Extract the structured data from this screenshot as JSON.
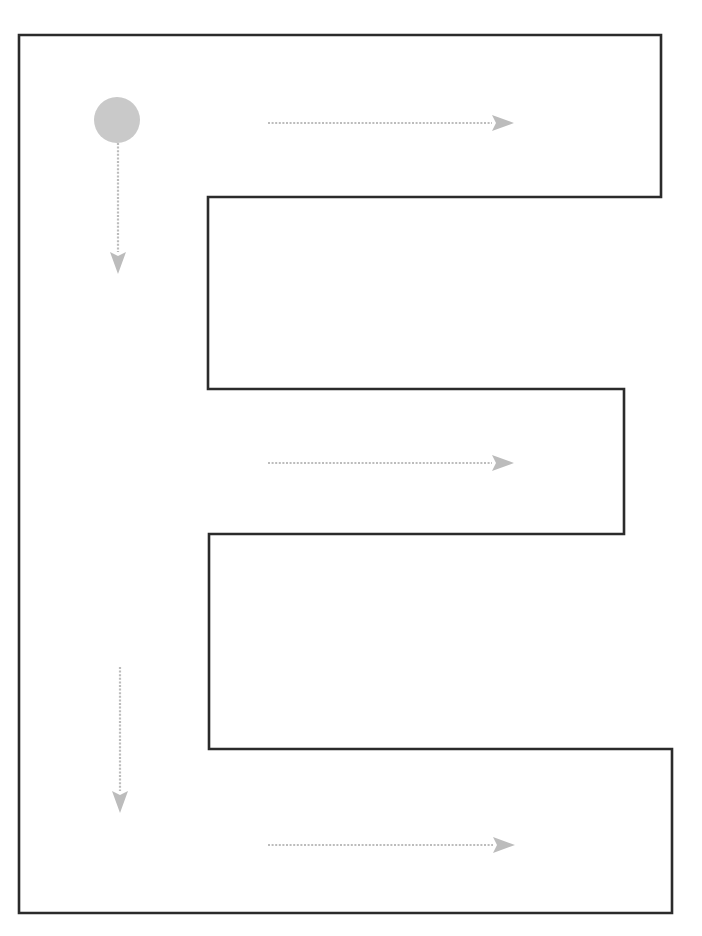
{
  "canvas": {
    "width": 702,
    "height": 936,
    "background_color": "#ffffff"
  },
  "diagram": {
    "kind": "boustrophedon-coverage-path"
  },
  "region": {
    "name": "e-shaped-region",
    "stroke_color": "#2b2b2b",
    "fill_color": "#ffffff",
    "stroke_width": 2.6,
    "outer_bounds": {
      "left": 19,
      "top": 35,
      "right": 672,
      "bottom": 915
    },
    "polygon_points": "19,35 661,35 661,197 208,197 208,389 624,389 624,534 209,534 209,749 672,749 672,913 19,913",
    "arms": [
      {
        "label": "top-arm",
        "right_edge_x": 661,
        "top_y": 35,
        "bottom_y": 197
      },
      {
        "label": "middle-arm",
        "right_edge_x": 624,
        "top_y": 389,
        "bottom_y": 534
      },
      {
        "label": "bottom-arm",
        "right_edge_x": 672,
        "top_y": 749,
        "bottom_y": 913
      }
    ],
    "notches": [
      {
        "label": "upper-notch",
        "left_edge_x": 208,
        "top_y": 197,
        "bottom_y": 389
      },
      {
        "label": "lower-notch",
        "left_edge_x": 209,
        "top_y": 534,
        "bottom_y": 749
      }
    ],
    "spine": {
      "label": "left-spine",
      "left_x": 19,
      "right_x": 208
    }
  },
  "start_marker": {
    "name": "start-point-circle",
    "center_x": 117,
    "center_y": 120,
    "radius": 23,
    "fill_color": "#c9c9c9"
  },
  "arrow_style": {
    "color": "#bcbcbc",
    "line_width": 2.2,
    "dash_pattern": "2 1.6",
    "head_length": 20,
    "head_half_width": 8
  },
  "arrows": [
    {
      "name": "arrow-down-1",
      "direction": "down",
      "x1": 118,
      "y1": 143,
      "x2": 118,
      "y2": 272,
      "order": 1
    },
    {
      "name": "arrow-right-1",
      "direction": "right",
      "x1": 268,
      "y1": 123,
      "x2": 512,
      "y2": 123,
      "order": 2
    },
    {
      "name": "arrow-right-2",
      "direction": "right",
      "x1": 268,
      "y1": 463,
      "x2": 512,
      "y2": 463,
      "order": 3
    },
    {
      "name": "arrow-down-2",
      "direction": "down",
      "x1": 120,
      "y1": 667,
      "x2": 120,
      "y2": 811,
      "order": 4
    },
    {
      "name": "arrow-right-3",
      "direction": "right",
      "x1": 268,
      "y1": 845,
      "x2": 513,
      "y2": 845,
      "order": 5
    }
  ]
}
